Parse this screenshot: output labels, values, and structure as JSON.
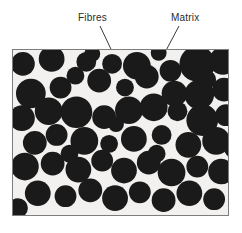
{
  "figure": {
    "type": "composite-microstructure-diagram",
    "caption_labels": {
      "fibres": "Fibres",
      "matrix": "Matrix"
    },
    "colors": {
      "fibre": "#1a1a1a",
      "matrix": "#f2f1ef",
      "frame_border": "#7d7d7d",
      "leader_line": "#3a3a3a",
      "label_text": "#2b2b2b",
      "page_background": "#ffffff"
    },
    "frame": {
      "x": 12,
      "y": 49,
      "width": 217,
      "height": 167
    },
    "leaders": [
      {
        "name": "fibres-leader",
        "from_label": "Fibres",
        "x1": 100,
        "y1": 26,
        "x2": 118,
        "y2": 64
      },
      {
        "name": "matrix-leader",
        "from_label": "Matrix",
        "x1": 179,
        "y1": 26,
        "x2": 162,
        "y2": 58
      }
    ],
    "chart_data": {
      "type": "scatter",
      "title": "",
      "xlabel": "",
      "ylabel": "",
      "xlim": [
        0,
        217
      ],
      "ylim": [
        0,
        167
      ],
      "grid": false,
      "legend_position": "none",
      "annotations": [
        {
          "text": "Fibres",
          "points_to": [
            106,
            15
          ]
        },
        {
          "text": "Matrix",
          "points_to": [
            150,
            9
          ]
        }
      ],
      "series": [
        {
          "name": "Fibres",
          "marker": "circle",
          "color": "#1a1a1a",
          "points": [
            {
              "cx": 10,
              "cy": 14,
              "r": 12
            },
            {
              "cx": 39,
              "cy": 9,
              "r": 13
            },
            {
              "cx": 74,
              "cy": 12,
              "r": 10
            },
            {
              "cx": 100,
              "cy": 14,
              "r": 10
            },
            {
              "cx": 125,
              "cy": 16,
              "r": 14
            },
            {
              "cx": 159,
              "cy": 21,
              "r": 11
            },
            {
              "cx": 186,
              "cy": 14,
              "r": 18
            },
            {
              "cx": 212,
              "cy": 11,
              "r": 14
            },
            {
              "cx": 18,
              "cy": 44,
              "r": 15
            },
            {
              "cx": 48,
              "cy": 38,
              "r": 11
            },
            {
              "cx": 63,
              "cy": 26,
              "r": 9
            },
            {
              "cx": 87,
              "cy": 31,
              "r": 12
            },
            {
              "cx": 113,
              "cy": 38,
              "r": 9
            },
            {
              "cx": 135,
              "cy": 27,
              "r": 12
            },
            {
              "cx": 163,
              "cy": 44,
              "r": 13
            },
            {
              "cx": 188,
              "cy": 45,
              "r": 15
            },
            {
              "cx": 213,
              "cy": 40,
              "r": 12
            },
            {
              "cx": 9,
              "cy": 69,
              "r": 13
            },
            {
              "cx": 36,
              "cy": 62,
              "r": 14
            },
            {
              "cx": 64,
              "cy": 63,
              "r": 16
            },
            {
              "cx": 92,
              "cy": 68,
              "r": 12
            },
            {
              "cx": 117,
              "cy": 61,
              "r": 14
            },
            {
              "cx": 142,
              "cy": 58,
              "r": 14
            },
            {
              "cx": 166,
              "cy": 62,
              "r": 10
            },
            {
              "cx": 191,
              "cy": 71,
              "r": 16
            },
            {
              "cx": 215,
              "cy": 66,
              "r": 11
            },
            {
              "cx": 22,
              "cy": 94,
              "r": 12
            },
            {
              "cx": 44,
              "cy": 86,
              "r": 11
            },
            {
              "cx": 72,
              "cy": 92,
              "r": 14
            },
            {
              "cx": 97,
              "cy": 95,
              "r": 9
            },
            {
              "cx": 122,
              "cy": 90,
              "r": 13
            },
            {
              "cx": 150,
              "cy": 86,
              "r": 10
            },
            {
              "cx": 177,
              "cy": 96,
              "r": 13
            },
            {
              "cx": 205,
              "cy": 92,
              "r": 14
            },
            {
              "cx": 12,
              "cy": 118,
              "r": 14
            },
            {
              "cx": 40,
              "cy": 115,
              "r": 12
            },
            {
              "cx": 66,
              "cy": 121,
              "r": 13
            },
            {
              "cx": 90,
              "cy": 112,
              "r": 11
            },
            {
              "cx": 112,
              "cy": 122,
              "r": 13
            },
            {
              "cx": 137,
              "cy": 114,
              "r": 12
            },
            {
              "cx": 160,
              "cy": 124,
              "r": 14
            },
            {
              "cx": 186,
              "cy": 118,
              "r": 11
            },
            {
              "cx": 210,
              "cy": 123,
              "r": 13
            },
            {
              "cx": 25,
              "cy": 145,
              "r": 13
            },
            {
              "cx": 53,
              "cy": 148,
              "r": 11
            },
            {
              "cx": 78,
              "cy": 142,
              "r": 12
            },
            {
              "cx": 103,
              "cy": 150,
              "r": 13
            },
            {
              "cx": 128,
              "cy": 144,
              "r": 11
            },
            {
              "cx": 152,
              "cy": 152,
              "r": 12
            },
            {
              "cx": 178,
              "cy": 145,
              "r": 13
            },
            {
              "cx": 203,
              "cy": 151,
              "r": 11
            },
            {
              "cx": 5,
              "cy": 160,
              "r": 10
            },
            {
              "cx": 222,
              "cy": 100,
              "r": 9
            },
            {
              "cx": 57,
              "cy": 105,
              "r": 9
            },
            {
              "cx": 104,
              "cy": 75,
              "r": 8
            },
            {
              "cx": 145,
              "cy": 105,
              "r": 9
            },
            {
              "cx": 196,
              "cy": 30,
              "r": 9
            },
            {
              "cx": 80,
              "cy": 4,
              "r": 8
            },
            {
              "cx": 147,
              "cy": 3,
              "r": 8
            }
          ]
        }
      ]
    }
  }
}
